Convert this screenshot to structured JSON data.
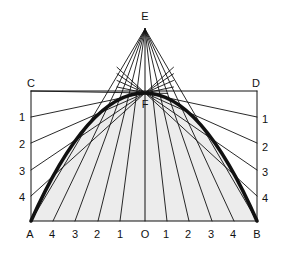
{
  "diagram": {
    "colors": {
      "line": "#111111",
      "fill": "#ececec",
      "background": "#ffffff"
    },
    "points": {
      "E": {
        "label": "E",
        "x": 145,
        "y": 29,
        "label_x": 145,
        "label_y": 16
      },
      "C": {
        "label": "C",
        "x": 31,
        "y": 91,
        "label_x": 31,
        "label_y": 83
      },
      "D": {
        "label": "D",
        "x": 257,
        "y": 91,
        "label_x": 256,
        "label_y": 83
      },
      "F": {
        "label": "F",
        "x": 145,
        "y": 93,
        "label_x": 145,
        "label_y": 104
      },
      "A": {
        "label": "A",
        "x": 31,
        "y": 221,
        "label_x": 30,
        "label_y": 234
      },
      "B": {
        "label": "B",
        "x": 257,
        "y": 221,
        "label_x": 257,
        "label_y": 234
      },
      "O": {
        "label": "O",
        "x": 145,
        "y": 221,
        "label_x": 145,
        "label_y": 234
      }
    },
    "left_marks": [
      {
        "label": "1",
        "x": 31,
        "y": 117,
        "label_x": 22,
        "label_y": 117
      },
      {
        "label": "2",
        "x": 31,
        "y": 143,
        "label_x": 22,
        "label_y": 144
      },
      {
        "label": "3",
        "x": 31,
        "y": 170,
        "label_x": 22,
        "label_y": 171
      },
      {
        "label": "4",
        "x": 31,
        "y": 196,
        "label_x": 22,
        "label_y": 197
      }
    ],
    "right_marks": [
      {
        "label": "1",
        "x": 257,
        "y": 117,
        "label_x": 265,
        "label_y": 119
      },
      {
        "label": "2",
        "x": 257,
        "y": 143,
        "label_x": 265,
        "label_y": 147
      },
      {
        "label": "3",
        "x": 257,
        "y": 170,
        "label_x": 265,
        "label_y": 172
      },
      {
        "label": "4",
        "x": 257,
        "y": 196,
        "label_x": 265,
        "label_y": 198
      }
    ],
    "bottom_marks": [
      {
        "label": "4",
        "x": 53,
        "label_x": 52,
        "label_y": 234
      },
      {
        "label": "3",
        "x": 75,
        "label_x": 75,
        "label_y": 234
      },
      {
        "label": "2",
        "x": 98,
        "label_x": 97,
        "label_y": 234
      },
      {
        "label": "1",
        "x": 120,
        "label_x": 120,
        "label_y": 234
      },
      {
        "label": "1",
        "x": 167,
        "label_x": 166,
        "label_y": 234
      },
      {
        "label": "2",
        "x": 189,
        "label_x": 188,
        "label_y": 234
      },
      {
        "label": "3",
        "x": 212,
        "label_x": 211,
        "label_y": 234
      },
      {
        "label": "4",
        "x": 234,
        "label_x": 233,
        "label_y": 234
      }
    ]
  }
}
